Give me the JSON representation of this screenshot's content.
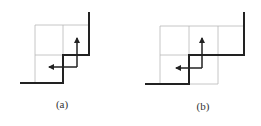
{
  "figure": {
    "panels": [
      {
        "id": "a",
        "label": "(a)",
        "grid": {
          "cols": 2,
          "rows": 2,
          "color": "#b8b8b8"
        },
        "staircase_path": "thick boundary stepping up-right",
        "arrows": [
          "up",
          "left"
        ]
      },
      {
        "id": "b",
        "label": "(b)",
        "grid": {
          "cols": 3,
          "rows": 2,
          "color": "#b8b8b8"
        },
        "staircase_path": "thick boundary stepping up-right",
        "arrows": [
          "up",
          "left"
        ]
      }
    ],
    "colors": {
      "line": "#222222",
      "grid": "#b8b8b8"
    }
  }
}
